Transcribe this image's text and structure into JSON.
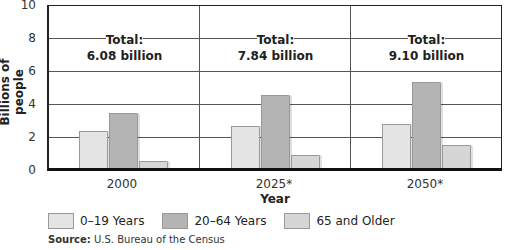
{
  "chart_data": {
    "type": "bar",
    "title": "",
    "xlabel": "Year",
    "ylabel": "Billions of people",
    "ylim": [
      0,
      10
    ],
    "yticks": [
      0,
      2,
      4,
      6,
      8,
      10
    ],
    "grid": true,
    "legend_position": "bottom",
    "categories": [
      "2000",
      "2025*",
      "2050*"
    ],
    "series": [
      {
        "name": "0–19 Years",
        "color": "#e4e4e4",
        "values": [
          2.3,
          2.6,
          2.7
        ]
      },
      {
        "name": "20–64 Years",
        "color": "#b4b4b4",
        "values": [
          3.4,
          4.5,
          5.3
        ]
      },
      {
        "name": "65 and Older",
        "color": "#d6d6d6",
        "values": [
          0.4,
          0.8,
          1.4
        ]
      }
    ],
    "annotations": [
      {
        "category": "2000",
        "text": "Total:\n6.08 billion"
      },
      {
        "category": "2025*",
        "text": "Total:\n7.84 billion"
      },
      {
        "category": "2050*",
        "text": "Total:\n9.10 billion"
      }
    ],
    "source": "U.S. Bureau of the Census"
  },
  "labels": {
    "ylabel": "Billions of people",
    "xlabel": "Year",
    "yticks": [
      "0",
      "2",
      "4",
      "6",
      "8",
      "10"
    ],
    "xticks": [
      "2000",
      "2025*",
      "2050*"
    ],
    "totals": [
      {
        "line1": "Total:",
        "line2": "6.08 billion"
      },
      {
        "line1": "Total:",
        "line2": "7.84 billion"
      },
      {
        "line1": "Total:",
        "line2": "9.10 billion"
      }
    ],
    "legend": [
      "0–19 Years",
      "20–64 Years",
      "65 and Older"
    ],
    "source_label": "Source:",
    "source_text": " U.S. Bureau of the Census"
  }
}
